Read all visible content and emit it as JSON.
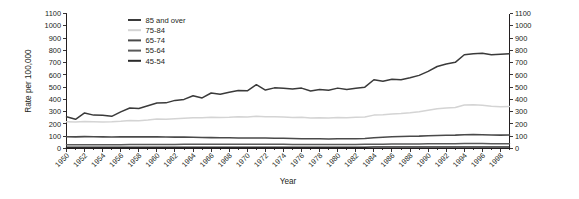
{
  "chart_data": {
    "type": "line",
    "title": "",
    "xlabel": "Year",
    "ylabel": "Rate per 100,000",
    "xlim": [
      1950,
      1999
    ],
    "ylim": [
      0,
      1100
    ],
    "grid": false,
    "legend_position": "top-left-inside",
    "x_tick_labels": [
      "1950",
      "1952",
      "1954",
      "1956",
      "1958",
      "1960",
      "1962",
      "1964",
      "1966",
      "1968",
      "1970",
      "1972",
      "1974",
      "1976",
      "1978",
      "1980",
      "1982",
      "1984",
      "1986",
      "1988",
      "1990",
      "1992",
      "1994",
      "1996",
      "1998"
    ],
    "y_tick_labels": [
      "0",
      "100",
      "200",
      "300",
      "400",
      "500",
      "600",
      "700",
      "800",
      "900",
      "1000",
      "1100"
    ],
    "y_tick_values": [
      0,
      100,
      200,
      300,
      400,
      500,
      600,
      700,
      800,
      900,
      1000,
      1100
    ],
    "right_axis_tick_labels": [
      "0",
      "100",
      "200",
      "300",
      "400",
      "500",
      "600",
      "700",
      "800",
      "900",
      "1000",
      "1100"
    ],
    "x": [
      1950,
      1951,
      1952,
      1953,
      1954,
      1955,
      1956,
      1957,
      1958,
      1959,
      1960,
      1961,
      1962,
      1963,
      1964,
      1965,
      1966,
      1967,
      1968,
      1969,
      1970,
      1971,
      1972,
      1973,
      1974,
      1975,
      1976,
      1977,
      1978,
      1979,
      1980,
      1981,
      1982,
      1983,
      1984,
      1985,
      1986,
      1987,
      1988,
      1989,
      1990,
      1991,
      1992,
      1993,
      1994,
      1995,
      1996,
      1997,
      1998,
      1999
    ],
    "series": [
      {
        "name": "85 and over",
        "color": "#3a3a3a",
        "width": 1.5,
        "values": [
          258,
          238,
          290,
          272,
          270,
          262,
          298,
          330,
          326,
          348,
          370,
          372,
          392,
          400,
          430,
          412,
          452,
          442,
          458,
          472,
          470,
          520,
          476,
          494,
          490,
          484,
          492,
          468,
          480,
          474,
          492,
          480,
          490,
          500,
          560,
          548,
          564,
          560,
          576,
          596,
          628,
          668,
          688,
          702,
          764,
          772,
          776,
          764,
          768,
          772
        ]
      },
      {
        "name": "75-84",
        "color": "#d4d4d4",
        "width": 1.5,
        "values": [
          218,
          216,
          220,
          218,
          216,
          218,
          222,
          228,
          226,
          232,
          240,
          238,
          242,
          246,
          250,
          250,
          254,
          252,
          254,
          258,
          256,
          262,
          258,
          258,
          256,
          252,
          254,
          248,
          250,
          248,
          252,
          250,
          254,
          256,
          272,
          276,
          282,
          286,
          292,
          300,
          312,
          324,
          330,
          334,
          354,
          356,
          352,
          344,
          340,
          342
        ]
      },
      {
        "name": "65-74",
        "color": "#4a4a4a",
        "width": 1.6,
        "values": [
          96,
          95,
          97,
          96,
          95,
          94,
          95,
          96,
          95,
          95,
          96,
          94,
          93,
          93,
          92,
          90,
          89,
          88,
          87,
          86,
          86,
          86,
          85,
          84,
          83,
          81,
          80,
          79,
          79,
          78,
          79,
          79,
          80,
          82,
          88,
          92,
          96,
          98,
          100,
          101,
          104,
          106,
          108,
          109,
          112,
          113,
          112,
          110,
          109,
          110
        ]
      },
      {
        "name": "55-64",
        "color": "#5a5a5a",
        "width": 1.5,
        "values": [
          30,
          30,
          31,
          31,
          31,
          31,
          31,
          32,
          32,
          32,
          33,
          33,
          33,
          34,
          34,
          34,
          34,
          34,
          34,
          34,
          34,
          34,
          34,
          34,
          34,
          33,
          33,
          33,
          33,
          33,
          33,
          33,
          33,
          34,
          35,
          35,
          36,
          36,
          37,
          37,
          38,
          38,
          39,
          39,
          40,
          40,
          40,
          39,
          39,
          39
        ]
      },
      {
        "name": "45-54",
        "color": "#2a2a2a",
        "width": 1.5,
        "values": [
          11,
          11,
          11,
          11,
          11,
          11,
          11,
          11,
          11,
          11,
          11,
          11,
          11,
          11,
          11,
          11,
          11,
          11,
          11,
          11,
          11,
          11,
          11,
          11,
          11,
          11,
          11,
          11,
          11,
          11,
          11,
          11,
          11,
          11,
          12,
          12,
          12,
          12,
          12,
          12,
          12,
          12,
          13,
          13,
          13,
          13,
          13,
          13,
          13,
          13
        ]
      }
    ],
    "legend": [
      {
        "label": "85 and over",
        "color": "#3a3a3a"
      },
      {
        "label": "75-84",
        "color": "#d4d4d4"
      },
      {
        "label": "65-74",
        "color": "#4a4a4a"
      },
      {
        "label": "55-64",
        "color": "#5a5a5a"
      },
      {
        "label": "45-54",
        "color": "#2a2a2a"
      }
    ]
  }
}
